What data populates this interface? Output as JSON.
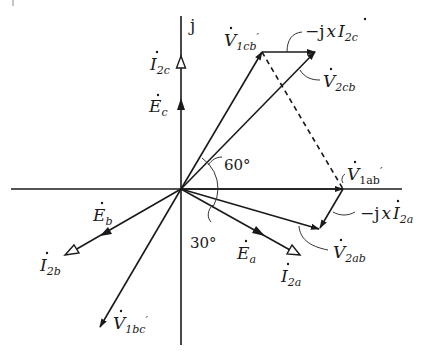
{
  "diagram": {
    "type": "phasor-diagram",
    "axis": {
      "imaginary_label": "j"
    },
    "angles": [
      {
        "label": "60°"
      },
      {
        "label": "30°"
      }
    ],
    "vectors": {
      "E_c": {
        "base": "E",
        "sub": "c",
        "arrow": "filled"
      },
      "I_2c": {
        "base": "I",
        "sub": "2c",
        "arrow": "hollow"
      },
      "E_a": {
        "base": "E",
        "sub": "a",
        "arrow": "filled"
      },
      "I_2a": {
        "base": "I",
        "sub": "2a",
        "arrow": "hollow"
      },
      "E_b": {
        "base": "E",
        "sub": "b",
        "arrow": "filled"
      },
      "I_2b": {
        "base": "I",
        "sub": "2b",
        "arrow": "hollow"
      },
      "V_1cb": {
        "base": "V",
        "sub": "1cb",
        "prime": "′"
      },
      "V_2cb": {
        "base": "V",
        "sub": "2cb"
      },
      "V_1ab": {
        "base": "V",
        "sub": "1ab",
        "prime": "′"
      },
      "V_2ab": {
        "base": "V",
        "sub": "2ab"
      },
      "V_1bc": {
        "base": "V",
        "sub": "1bc",
        "prime": "′"
      },
      "drop_c": {
        "prefix": "−j",
        "x": "x",
        "base": "I",
        "sub": "2c"
      },
      "drop_a": {
        "prefix": "−j",
        "x": "x",
        "base": "I",
        "sub": "2a"
      }
    },
    "colors": {
      "ink": "#1a1a1a",
      "background": "#ffffff"
    }
  }
}
